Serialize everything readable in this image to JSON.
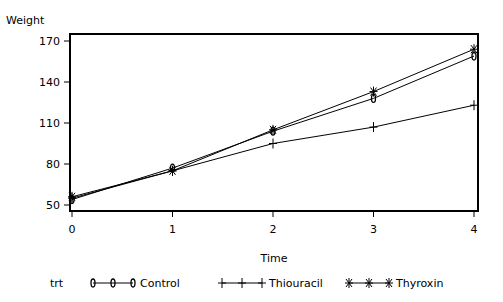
{
  "chart_data": {
    "type": "line",
    "title": "",
    "xlabel": "Time",
    "ylabel": "Weight",
    "x": [
      0,
      1,
      2,
      3,
      4
    ],
    "xticks": [
      "0",
      "1",
      "2",
      "3",
      "4"
    ],
    "yticks": [
      "50",
      "80",
      "110",
      "140",
      "170"
    ],
    "ylim": [
      50,
      170
    ],
    "legend_title": "trt",
    "legend_position": "bottom",
    "series": [
      {
        "name": "Control",
        "marker": "0",
        "values": [
          54,
          77,
          104,
          128,
          159
        ]
      },
      {
        "name": "Thiouracil",
        "marker": "+",
        "values": [
          55,
          75,
          95,
          107,
          123
        ]
      },
      {
        "name": "Thyroxin",
        "marker": "*",
        "values": [
          56,
          75,
          105,
          133,
          164
        ]
      }
    ]
  }
}
